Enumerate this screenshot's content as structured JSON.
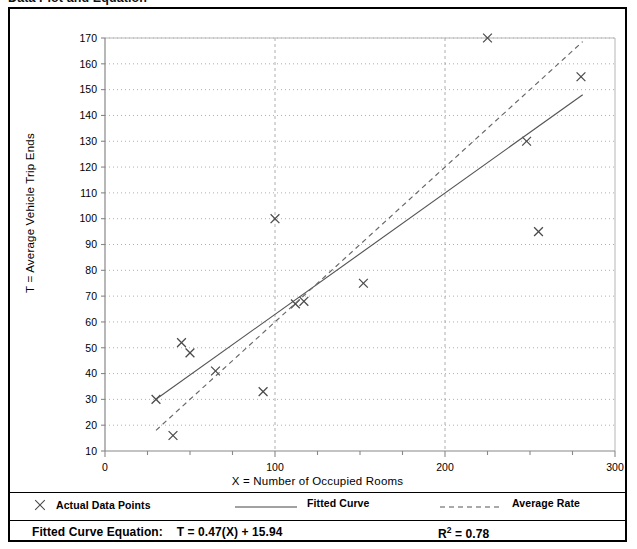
{
  "page": {
    "caption": "Data Plot and Equation"
  },
  "chart_data": {
    "type": "scatter",
    "title": "Data Plot and Equation",
    "xlabel": "X = Number of Occupied Rooms",
    "ylabel": "T = Average Vehicle Trip Ends",
    "xlim": [
      0,
      300
    ],
    "ylim": [
      10,
      170
    ],
    "xticks": [
      0,
      100,
      200,
      300
    ],
    "xtick_labels": [
      "0",
      "100",
      "200",
      "300"
    ],
    "xminor_step": 25,
    "yticks": [
      10,
      20,
      30,
      40,
      50,
      60,
      70,
      80,
      90,
      100,
      110,
      120,
      130,
      140,
      150,
      160,
      170
    ],
    "ytick_labels": [
      "10",
      "20",
      "30",
      "40",
      "50",
      "60",
      "70",
      "80",
      "90",
      "100",
      "110",
      "120",
      "130",
      "140",
      "150",
      "160",
      "170"
    ],
    "grid": true,
    "grid_style": "dotted",
    "legend_position": "below-plot",
    "series": [
      {
        "name": "Actual Data Points",
        "type": "scatter",
        "marker": "x",
        "points": [
          {
            "x": 30,
            "y": 30
          },
          {
            "x": 40,
            "y": 16
          },
          {
            "x": 45,
            "y": 52
          },
          {
            "x": 50,
            "y": 48
          },
          {
            "x": 65,
            "y": 41
          },
          {
            "x": 93,
            "y": 33
          },
          {
            "x": 100,
            "y": 100
          },
          {
            "x": 112,
            "y": 67
          },
          {
            "x": 117,
            "y": 68
          },
          {
            "x": 152,
            "y": 75
          },
          {
            "x": 225,
            "y": 170
          },
          {
            "x": 248,
            "y": 130
          },
          {
            "x": 255,
            "y": 95
          },
          {
            "x": 280,
            "y": 155
          }
        ]
      },
      {
        "name": "Fitted Curve",
        "type": "line",
        "style": "solid",
        "slope": 0.47,
        "intercept": 15.94,
        "x_start": 30,
        "x_end": 281
      },
      {
        "name": "Average Rate",
        "type": "line",
        "style": "dashed",
        "slope": 0.6,
        "intercept": 0,
        "x_start": 30,
        "x_end": 281
      }
    ],
    "annotations": {
      "equation_label": "Fitted Curve Equation:",
      "equation": "T = 0.47(X) + 15.94",
      "r_squared_symbol": "R",
      "r_squared_exponent": "2",
      "r_squared_value": "= 0.78"
    }
  },
  "legend": {
    "items": [
      {
        "label": "Actual Data Points",
        "marker": "x-marker-icon"
      },
      {
        "label": "Fitted Curve",
        "marker": "solid-line-icon"
      },
      {
        "label": "Average Rate",
        "marker": "dashed-line-icon"
      }
    ]
  },
  "footer": {
    "equation_label": "Fitted Curve Equation:",
    "equation_value": "T = 0.47(X) + 15.94",
    "r2_base": "R",
    "r2_sup": "2",
    "r2_rest": " = 0.78"
  },
  "colors": {
    "frame": "#000000",
    "grid": "#9a9a9a",
    "axis": "#888888",
    "marker": "#4a4a4a",
    "fitted_line": "#555555",
    "average_line": "#666666",
    "text": "#000000"
  }
}
